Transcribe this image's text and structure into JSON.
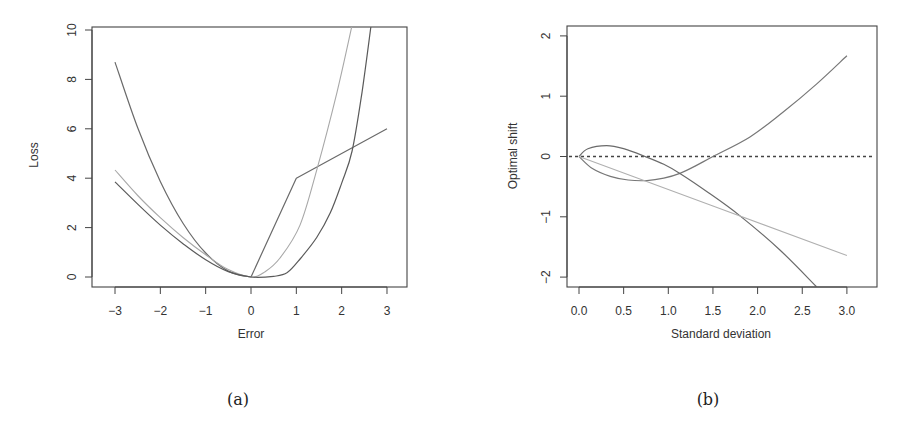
{
  "chart_data": [
    {
      "id": "a",
      "type": "line",
      "caption": "(a)",
      "title": "",
      "xlabel": "Error",
      "ylabel": "Loss",
      "xlim": [
        -3.35,
        3.55
      ],
      "ylim": [
        -0.4,
        10.2
      ],
      "xticks": [
        -3,
        -2,
        -1,
        0,
        1,
        2,
        3
      ],
      "xtick_labels": [
        "−3",
        "−2",
        "−1",
        "0",
        "1",
        "2",
        "3"
      ],
      "yticks": [
        0,
        2,
        4,
        6,
        8,
        10
      ],
      "ytick_labels": [
        "0",
        "2",
        "4",
        "6",
        "8",
        "10"
      ],
      "grid": false,
      "legend": null,
      "series": [
        {
          "name": "quadratic-left + piecewise linear right",
          "color": "#6a6a6a",
          "width": 1.2,
          "x": [
            -3,
            -2.5,
            -2,
            -1.5,
            -1,
            -0.5,
            0,
            1,
            3
          ],
          "y": [
            8.7,
            6.04,
            3.87,
            2.18,
            0.97,
            0.24,
            0,
            4,
            6
          ]
        },
        {
          "name": "asymmetric loss (light)",
          "color": "#a8a8a8",
          "width": 1.1,
          "x": [
            -3,
            -2.5,
            -2,
            -1.5,
            -1,
            -0.5,
            0,
            0.3,
            0.64,
            1.08,
            1.46,
            1.9,
            2.23
          ],
          "y": [
            4.33,
            3.3,
            2.4,
            1.6,
            0.9,
            0.3,
            0,
            0.2,
            0.77,
            2.1,
            4.4,
            7.5,
            10.2
          ]
        },
        {
          "name": "asymmetric loss (dark, flat right)",
          "color": "#5a5a5a",
          "width": 1.2,
          "x": [
            -3,
            -2.5,
            -2,
            -1.5,
            -1,
            -0.5,
            0,
            0.5,
            0.8,
            1.1,
            1.45,
            1.75,
            2.0,
            2.23,
            2.45,
            2.65
          ],
          "y": [
            3.85,
            2.95,
            2.1,
            1.35,
            0.7,
            0.22,
            0,
            0.03,
            0.18,
            0.77,
            1.6,
            2.6,
            3.8,
            5.1,
            7.5,
            10.2
          ]
        }
      ]
    },
    {
      "id": "b",
      "type": "line",
      "caption": "(b)",
      "title": "",
      "xlabel": "Standard deviation",
      "ylabel": "Optimal shift",
      "xlim": [
        -0.14,
        3.3
      ],
      "ylim": [
        -2.15,
        2.2
      ],
      "xticks": [
        0,
        0.5,
        1,
        1.5,
        2,
        2.5,
        3
      ],
      "xtick_labels": [
        "0.0",
        "0.5",
        "1.0",
        "1.5",
        "2.0",
        "2.5",
        "3.0"
      ],
      "yticks": [
        -2,
        -1,
        0,
        1,
        2
      ],
      "ytick_labels": [
        "−2",
        "−1",
        "0",
        "1",
        "2"
      ],
      "grid": false,
      "legend": null,
      "reference_line": {
        "y": 0,
        "style": "dashed",
        "color": "#444444"
      },
      "series": [
        {
          "name": "curve rising (upper arm)",
          "color": "#777777",
          "width": 1.2,
          "x": [
            0,
            0.15,
            0.35,
            0.55,
            0.76,
            0.95,
            1.13,
            1.3,
            1.5,
            1.91,
            2.28,
            2.66,
            3.0
          ],
          "y": [
            0,
            -0.2,
            -0.33,
            -0.39,
            -0.4,
            -0.36,
            -0.28,
            -0.16,
            0,
            0.32,
            0.73,
            1.2,
            1.67
          ]
        },
        {
          "name": "curve falling (lower arm)",
          "color": "#6a6a6a",
          "width": 1.2,
          "x": [
            0,
            0.1,
            0.31,
            0.5,
            0.74,
            0.95,
            1.13,
            1.45,
            1.8,
            2.25,
            2.66
          ],
          "y": [
            0,
            0.13,
            0.18,
            0.13,
            0,
            -0.13,
            -0.28,
            -0.6,
            -0.98,
            -1.55,
            -2.16
          ]
        },
        {
          "name": "linear",
          "color": "#b0b0b0",
          "width": 1.1,
          "x": [
            0,
            3.0
          ],
          "y": [
            0,
            -1.64
          ]
        }
      ]
    }
  ],
  "panels": {
    "a": {
      "caption": "(a)",
      "xlabel": "Error",
      "ylabel": "Loss"
    },
    "b": {
      "caption": "(b)",
      "xlabel": "Standard deviation",
      "ylabel": "Optimal shift"
    }
  }
}
